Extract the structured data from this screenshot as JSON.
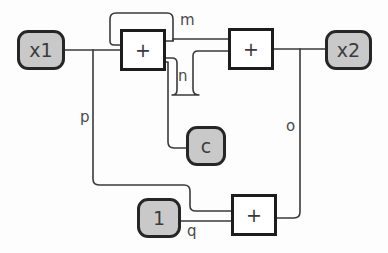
{
  "diagram": {
    "background_color": "#fdfdfd",
    "node_fill_color": "#c9c9c9",
    "node_border_color": "#262626",
    "adder_fill_color": "#ffffff",
    "adder_border_color": "#1d1d1d",
    "wire_color": "#3a3a3a",
    "label_color": "#4a4a4a",
    "nodes": [
      {
        "id": "x1",
        "label": "x1",
        "shape": "rounded-rect",
        "fill": "gray",
        "x": 17,
        "y": 30,
        "w": 48,
        "h": 40
      },
      {
        "id": "x2",
        "label": "x2",
        "shape": "rounded-rect",
        "fill": "gray",
        "x": 325,
        "y": 30,
        "w": 47,
        "h": 40
      },
      {
        "id": "c",
        "label": "c",
        "shape": "rounded-rect",
        "fill": "gray",
        "x": 186,
        "y": 126,
        "w": 40,
        "h": 40
      },
      {
        "id": "one",
        "label": "1",
        "shape": "rounded-rect",
        "fill": "gray",
        "x": 137,
        "y": 198,
        "w": 44,
        "h": 40
      }
    ],
    "adders": [
      {
        "id": "add1",
        "label": "+",
        "shape": "square",
        "fill": "white",
        "x": 120,
        "y": 29,
        "w": 46,
        "h": 42
      },
      {
        "id": "add2",
        "label": "+",
        "shape": "square",
        "fill": "white",
        "x": 228,
        "y": 28,
        "w": 46,
        "h": 42
      },
      {
        "id": "add3",
        "label": "+",
        "shape": "square",
        "fill": "white",
        "x": 231,
        "y": 194,
        "w": 46,
        "h": 42
      }
    ],
    "wire_labels": [
      {
        "id": "m",
        "label": "m",
        "x": 180,
        "y": 13
      },
      {
        "id": "n",
        "label": "n",
        "x": 178,
        "y": 69
      },
      {
        "id": "o",
        "label": "o",
        "x": 286,
        "y": 119
      },
      {
        "id": "p",
        "label": "p",
        "x": 80,
        "y": 110
      },
      {
        "id": "q",
        "label": "q",
        "x": 187,
        "y": 224
      }
    ],
    "edges": [
      {
        "id": "x1-to-add1",
        "from": "x1",
        "to": "add1",
        "label": ""
      },
      {
        "id": "add1-to-m-loop",
        "from": "add1",
        "to": "add1",
        "label": "m"
      },
      {
        "id": "m-to-add2",
        "from": "add1",
        "to": "add2",
        "label": "m"
      },
      {
        "id": "add1-to-add2-n",
        "from": "add1",
        "to": "add2",
        "label": "n"
      },
      {
        "id": "add1-to-c",
        "from": "add1",
        "to": "c",
        "label": ""
      },
      {
        "id": "add2-to-x2",
        "from": "add2",
        "to": "x2",
        "label": ""
      },
      {
        "id": "x2-to-add3-o",
        "from": "add2",
        "to": "add3",
        "label": "o"
      },
      {
        "id": "x1-to-add3-p",
        "from": "x1",
        "to": "add3",
        "label": "p"
      },
      {
        "id": "one-to-add3-q",
        "from": "one",
        "to": "add3",
        "label": "q"
      }
    ]
  }
}
